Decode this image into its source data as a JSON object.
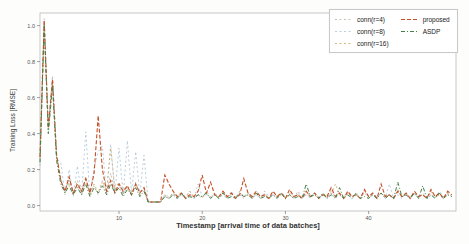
{
  "figure": {
    "background": "#fdfdfb",
    "plot_background": "#ffffff",
    "frame_color": "#b0b0b0"
  },
  "axes": {
    "tick_color": "#777777",
    "tick_label_color": "#555555",
    "xtick_labels": [
      "10",
      "20",
      "30",
      "40"
    ],
    "ytick_labels": [
      "0.0",
      "0.2",
      "0.4",
      "0.6",
      "0.8",
      "1.0"
    ]
  },
  "chart_data": {
    "type": "line",
    "title": "",
    "xlabel": "Timestamp [arrival time of data batches]",
    "ylabel": "Training Loss [RMSE]",
    "xlim": [
      0.5,
      50.5
    ],
    "ylim": [
      -0.03,
      1.07
    ],
    "xticks": [
      10,
      20,
      30,
      40
    ],
    "yticks": [
      0.0,
      0.2,
      0.4,
      0.6,
      0.8,
      1.0
    ],
    "grid": false,
    "legend_position": "upper right",
    "legend_columns": 2,
    "x": [
      0.5,
      1,
      1.5,
      2,
      2.5,
      3,
      3.5,
      4,
      4.5,
      5,
      5.5,
      6,
      6.5,
      7,
      7.5,
      8,
      8.5,
      9,
      9.5,
      10,
      10.5,
      11,
      11.5,
      12,
      12.5,
      13,
      13.5,
      14,
      14.5,
      15,
      15.5,
      16,
      16.5,
      17,
      17.5,
      18,
      18.5,
      19,
      19.5,
      20,
      20.5,
      21,
      21.5,
      22,
      22.5,
      23,
      23.5,
      24,
      24.5,
      25,
      25.5,
      26,
      26.5,
      27,
      27.5,
      28,
      28.5,
      29,
      29.5,
      30,
      30.5,
      31,
      31.5,
      32,
      32.5,
      33,
      33.5,
      34,
      34.5,
      35,
      35.5,
      36,
      36.5,
      37,
      37.5,
      38,
      38.5,
      39,
      39.5,
      40,
      40.5,
      41,
      41.5,
      42,
      42.5,
      43,
      43.5,
      44,
      44.5,
      45,
      45.5,
      46,
      46.5,
      47,
      47.5,
      48,
      48.5,
      49,
      49.5,
      50
    ],
    "series": [
      {
        "name": "conn(r=4)",
        "color": "#b7b3a4",
        "dash": "2 2.5",
        "width": 0.8,
        "values": [
          0.28,
          1.04,
          0.45,
          0.72,
          0.28,
          0.13,
          0.08,
          0.15,
          0.07,
          0.12,
          0.06,
          0.14,
          0.08,
          0.11,
          0.06,
          0.13,
          0.07,
          0.18,
          0.08,
          0.12,
          0.07,
          0.1,
          0.06,
          0.12,
          0.07,
          0.09,
          0.02,
          0.02,
          0.02,
          0.02,
          0.06,
          0.05,
          0.07,
          0.04,
          0.06,
          0.05,
          0.08,
          0.04,
          0.06,
          0.05,
          0.07,
          0.04,
          0.06,
          0.05,
          0.08,
          0.04,
          0.07,
          0.05,
          0.06,
          0.04,
          0.07,
          0.05,
          0.06,
          0.04,
          0.08,
          0.05,
          0.06,
          0.04,
          0.07,
          0.05,
          0.06,
          0.04,
          0.08,
          0.05,
          0.06,
          0.04,
          0.07,
          0.05,
          0.06,
          0.04,
          0.08,
          0.05,
          0.06,
          0.04,
          0.07,
          0.05,
          0.06,
          0.04,
          0.08,
          0.05,
          0.06,
          0.04,
          0.07,
          0.05,
          0.06,
          0.04,
          0.08,
          0.05,
          0.06,
          0.04,
          0.07,
          0.05,
          0.06,
          0.04,
          0.08,
          0.05,
          0.06,
          0.04,
          0.07,
          0.06
        ]
      },
      {
        "name": "conn(r=8)",
        "color": "#a4c2d6",
        "dash": "2 2.5",
        "width": 0.8,
        "values": [
          0.22,
          1.0,
          0.4,
          0.66,
          0.26,
          0.24,
          0.06,
          0.2,
          0.05,
          0.22,
          0.06,
          0.41,
          0.05,
          0.21,
          0.3,
          0.33,
          0.06,
          0.34,
          0.07,
          0.32,
          0.06,
          0.36,
          0.07,
          0.3,
          0.06,
          0.28,
          0.02,
          0.02,
          0.02,
          0.02,
          0.05,
          0.04,
          0.06,
          0.04,
          0.07,
          0.04,
          0.06,
          0.04,
          0.12,
          0.05,
          0.06,
          0.04,
          0.07,
          0.04,
          0.06,
          0.04,
          0.08,
          0.04,
          0.06,
          0.05,
          0.07,
          0.04,
          0.06,
          0.04,
          0.07,
          0.04,
          0.06,
          0.05,
          0.07,
          0.04,
          0.06,
          0.04,
          0.07,
          0.04,
          0.06,
          0.05,
          0.07,
          0.04,
          0.06,
          0.04,
          0.07,
          0.04,
          0.06,
          0.05,
          0.07,
          0.04,
          0.06,
          0.04,
          0.07,
          0.04,
          0.06,
          0.05,
          0.07,
          0.04,
          0.12,
          0.04,
          0.06,
          0.04,
          0.07,
          0.05,
          0.06,
          0.04,
          0.07,
          0.04,
          0.06,
          0.04,
          0.08,
          0.05,
          0.06,
          0.05
        ]
      },
      {
        "name": "conn(r=16)",
        "color": "#c9a468",
        "dash": "2 2.5",
        "width": 0.8,
        "values": [
          0.26,
          1.02,
          0.42,
          0.7,
          0.27,
          0.15,
          0.07,
          0.13,
          0.06,
          0.14,
          0.07,
          0.16,
          0.06,
          0.12,
          0.07,
          0.14,
          0.08,
          0.32,
          0.09,
          0.13,
          0.06,
          0.11,
          0.07,
          0.13,
          0.06,
          0.1,
          0.02,
          0.02,
          0.02,
          0.02,
          0.06,
          0.04,
          0.07,
          0.05,
          0.06,
          0.04,
          0.08,
          0.05,
          0.06,
          0.04,
          0.08,
          0.05,
          0.06,
          0.04,
          0.07,
          0.05,
          0.06,
          0.04,
          0.08,
          0.05,
          0.06,
          0.04,
          0.07,
          0.05,
          0.06,
          0.04,
          0.08,
          0.05,
          0.06,
          0.04,
          0.07,
          0.05,
          0.06,
          0.04,
          0.08,
          0.05,
          0.06,
          0.04,
          0.07,
          0.05,
          0.06,
          0.12,
          0.06,
          0.04,
          0.07,
          0.05,
          0.06,
          0.04,
          0.08,
          0.05,
          0.06,
          0.04,
          0.07,
          0.05,
          0.06,
          0.04,
          0.09,
          0.05,
          0.06,
          0.04,
          0.07,
          0.05,
          0.06,
          0.04,
          0.08,
          0.05,
          0.06,
          0.04,
          0.07,
          0.05
        ]
      },
      {
        "name": "proposed",
        "color": "#c44e26",
        "dash": "4 2",
        "width": 1.1,
        "values": [
          0.27,
          1.03,
          0.43,
          0.7,
          0.28,
          0.14,
          0.08,
          0.16,
          0.07,
          0.12,
          0.08,
          0.15,
          0.07,
          0.18,
          0.5,
          0.2,
          0.08,
          0.14,
          0.07,
          0.12,
          0.08,
          0.11,
          0.06,
          0.12,
          0.07,
          0.1,
          0.02,
          0.02,
          0.02,
          0.02,
          0.17,
          0.12,
          0.08,
          0.05,
          0.07,
          0.04,
          0.06,
          0.05,
          0.08,
          0.17,
          0.07,
          0.13,
          0.06,
          0.05,
          0.08,
          0.05,
          0.07,
          0.04,
          0.06,
          0.15,
          0.07,
          0.05,
          0.08,
          0.05,
          0.06,
          0.04,
          0.08,
          0.05,
          0.07,
          0.04,
          0.09,
          0.05,
          0.06,
          0.04,
          0.08,
          0.05,
          0.07,
          0.04,
          0.06,
          0.05,
          0.1,
          0.05,
          0.07,
          0.04,
          0.08,
          0.05,
          0.06,
          0.04,
          0.09,
          0.05,
          0.07,
          0.04,
          0.12,
          0.05,
          0.06,
          0.04,
          0.08,
          0.05,
          0.07,
          0.04,
          0.08,
          0.05,
          0.06,
          0.04,
          0.09,
          0.05,
          0.07,
          0.04,
          0.08,
          0.06
        ]
      },
      {
        "name": "ASDP",
        "color": "#47804a",
        "dash": "4 2 1 2",
        "width": 1.0,
        "values": [
          0.24,
          1.0,
          0.4,
          0.67,
          0.25,
          0.12,
          0.07,
          0.11,
          0.06,
          0.1,
          0.06,
          0.12,
          0.05,
          0.1,
          0.07,
          0.11,
          0.06,
          0.12,
          0.07,
          0.1,
          0.05,
          0.09,
          0.06,
          0.1,
          0.05,
          0.08,
          0.02,
          0.02,
          0.02,
          0.02,
          0.05,
          0.04,
          0.06,
          0.04,
          0.07,
          0.04,
          0.05,
          0.04,
          0.06,
          0.05,
          0.07,
          0.04,
          0.06,
          0.04,
          0.07,
          0.04,
          0.05,
          0.04,
          0.07,
          0.05,
          0.06,
          0.04,
          0.07,
          0.04,
          0.05,
          0.04,
          0.06,
          0.04,
          0.07,
          0.04,
          0.06,
          0.04,
          0.05,
          0.04,
          0.12,
          0.05,
          0.06,
          0.04,
          0.07,
          0.04,
          0.06,
          0.04,
          0.1,
          0.04,
          0.06,
          0.04,
          0.07,
          0.04,
          0.05,
          0.04,
          0.06,
          0.04,
          0.07,
          0.04,
          0.06,
          0.04,
          0.13,
          0.05,
          0.06,
          0.04,
          0.07,
          0.04,
          0.11,
          0.04,
          0.06,
          0.04,
          0.07,
          0.04,
          0.06,
          0.05
        ]
      }
    ]
  }
}
